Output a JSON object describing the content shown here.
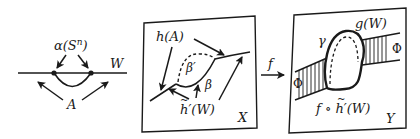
{
  "figure": {
    "panels": [
      {
        "id": "left",
        "labels": {
          "alpha": "α(S",
          "alpha_sup": "n",
          "alpha_close": ")",
          "w": "W",
          "a": "A"
        }
      },
      {
        "id": "x",
        "labels": {
          "h_a": "h(A)",
          "beta_prime": "β′",
          "beta": "β",
          "h_tilde": "h",
          "h_tilde_rest": "′(W)",
          "tilde": "~",
          "space": "X"
        }
      },
      {
        "id": "map",
        "labels": {
          "f": "f"
        }
      },
      {
        "id": "y",
        "labels": {
          "gamma": "γ",
          "g_w": "g(W)",
          "phi_left": "Φ",
          "phi_right": "Φ",
          "f_circ": "f ∘ ",
          "h_tilde": "h",
          "h_tilde_rest": "′(W)",
          "tilde": "~",
          "space": "Y"
        }
      }
    ],
    "colors": {
      "ink": "#1a1a1a",
      "background": "#ffffff"
    }
  }
}
